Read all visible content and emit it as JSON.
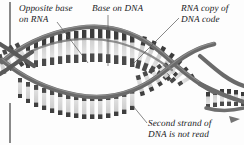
{
  "figure": {
    "background_color": "#fdfdfd",
    "strand_color": "#6a6a6a",
    "strand_dark_color": "#4a4a4a",
    "base_dark_color": "#3c3c3c",
    "base_light_color": "#d8d8d8",
    "leader_color": "#555555",
    "text_color": "#17171a",
    "edge_rule_color": "#2a2a2a"
  },
  "labels": {
    "opposite_base": "Opposite base\non RNA",
    "base_on_dna": "Base on DNA",
    "rna_copy": "RNA copy of\nDNA code",
    "second_strand": "Second strand of\nDNA is not read"
  },
  "leaders": [
    {
      "name": "leader-opposite-base",
      "x1": 57,
      "y1": 22,
      "x2": 88,
      "y2": 63
    },
    {
      "name": "leader-base-on-dna",
      "x1": 108,
      "y1": 15,
      "x2": 108,
      "y2": 66
    },
    {
      "name": "leader-rna-copy",
      "x1": 179,
      "y1": 18,
      "x2": 131,
      "y2": 66
    },
    {
      "name": "leader-second-strand",
      "x1": 147,
      "y1": 123,
      "x2": 133,
      "y2": 106
    }
  ],
  "edge_rules": [
    {
      "name": "left-page-rule-top",
      "x": 10,
      "y1": 2,
      "y2": 46
    },
    {
      "name": "left-page-rule-bottom",
      "x": 10,
      "y1": 103,
      "y2": 143
    }
  ]
}
